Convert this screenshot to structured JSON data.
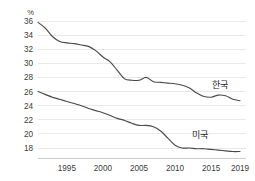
{
  "chart_data": {
    "type": "line",
    "title": "",
    "subtitle": "",
    "xlabel": "",
    "ylabel": "",
    "unit_label": "%",
    "grid": true,
    "legend_position": "inline-right",
    "xlim": [
      1991,
      2019
    ],
    "ylim": [
      17,
      36.5
    ],
    "yticks": [
      36,
      34,
      32,
      30,
      28,
      26,
      24,
      22,
      20,
      18
    ],
    "ytick_labels": [
      "36",
      "34",
      "32",
      "30",
      "28",
      "26",
      "24",
      "22",
      "20",
      "18"
    ],
    "xticks": [
      1995,
      2000,
      2005,
      2010,
      2015,
      2019
    ],
    "xtick_labels": [
      "1995",
      "2000",
      "2005",
      "2010",
      "2015",
      "2019"
    ],
    "x": [
      1991,
      1992,
      1993,
      1994,
      1995,
      1996,
      1997,
      1998,
      1999,
      2000,
      2001,
      2002,
      2003,
      2004,
      2005,
      2006,
      2007,
      2008,
      2009,
      2010,
      2011,
      2012,
      2013,
      2014,
      2015,
      2016,
      2017,
      2018,
      2019
    ],
    "series": [
      {
        "name": "한국",
        "label": "한국",
        "color": "#4a4a4a",
        "label_x": 2016.2,
        "label_y": 26.5,
        "values": [
          35.8,
          35.0,
          33.8,
          33.1,
          32.9,
          32.8,
          32.6,
          32.4,
          31.8,
          30.9,
          30.2,
          29.0,
          27.8,
          27.6,
          27.6,
          28.0,
          27.4,
          27.3,
          27.2,
          27.1,
          26.9,
          26.5,
          25.8,
          25.3,
          25.2,
          25.5,
          25.4,
          24.9,
          24.7
        ]
      },
      {
        "name": "미국",
        "label": "미국",
        "color": "#4a4a4a",
        "label_x": 2013.4,
        "label_y": 19.4,
        "values": [
          26.0,
          25.6,
          25.2,
          24.9,
          24.6,
          24.3,
          24.0,
          23.6,
          23.3,
          23.0,
          22.6,
          22.2,
          21.9,
          21.5,
          21.2,
          21.2,
          21.0,
          20.4,
          19.4,
          18.4,
          18.0,
          18.0,
          17.9,
          17.9,
          17.8,
          17.7,
          17.6,
          17.5,
          17.5
        ]
      }
    ]
  }
}
